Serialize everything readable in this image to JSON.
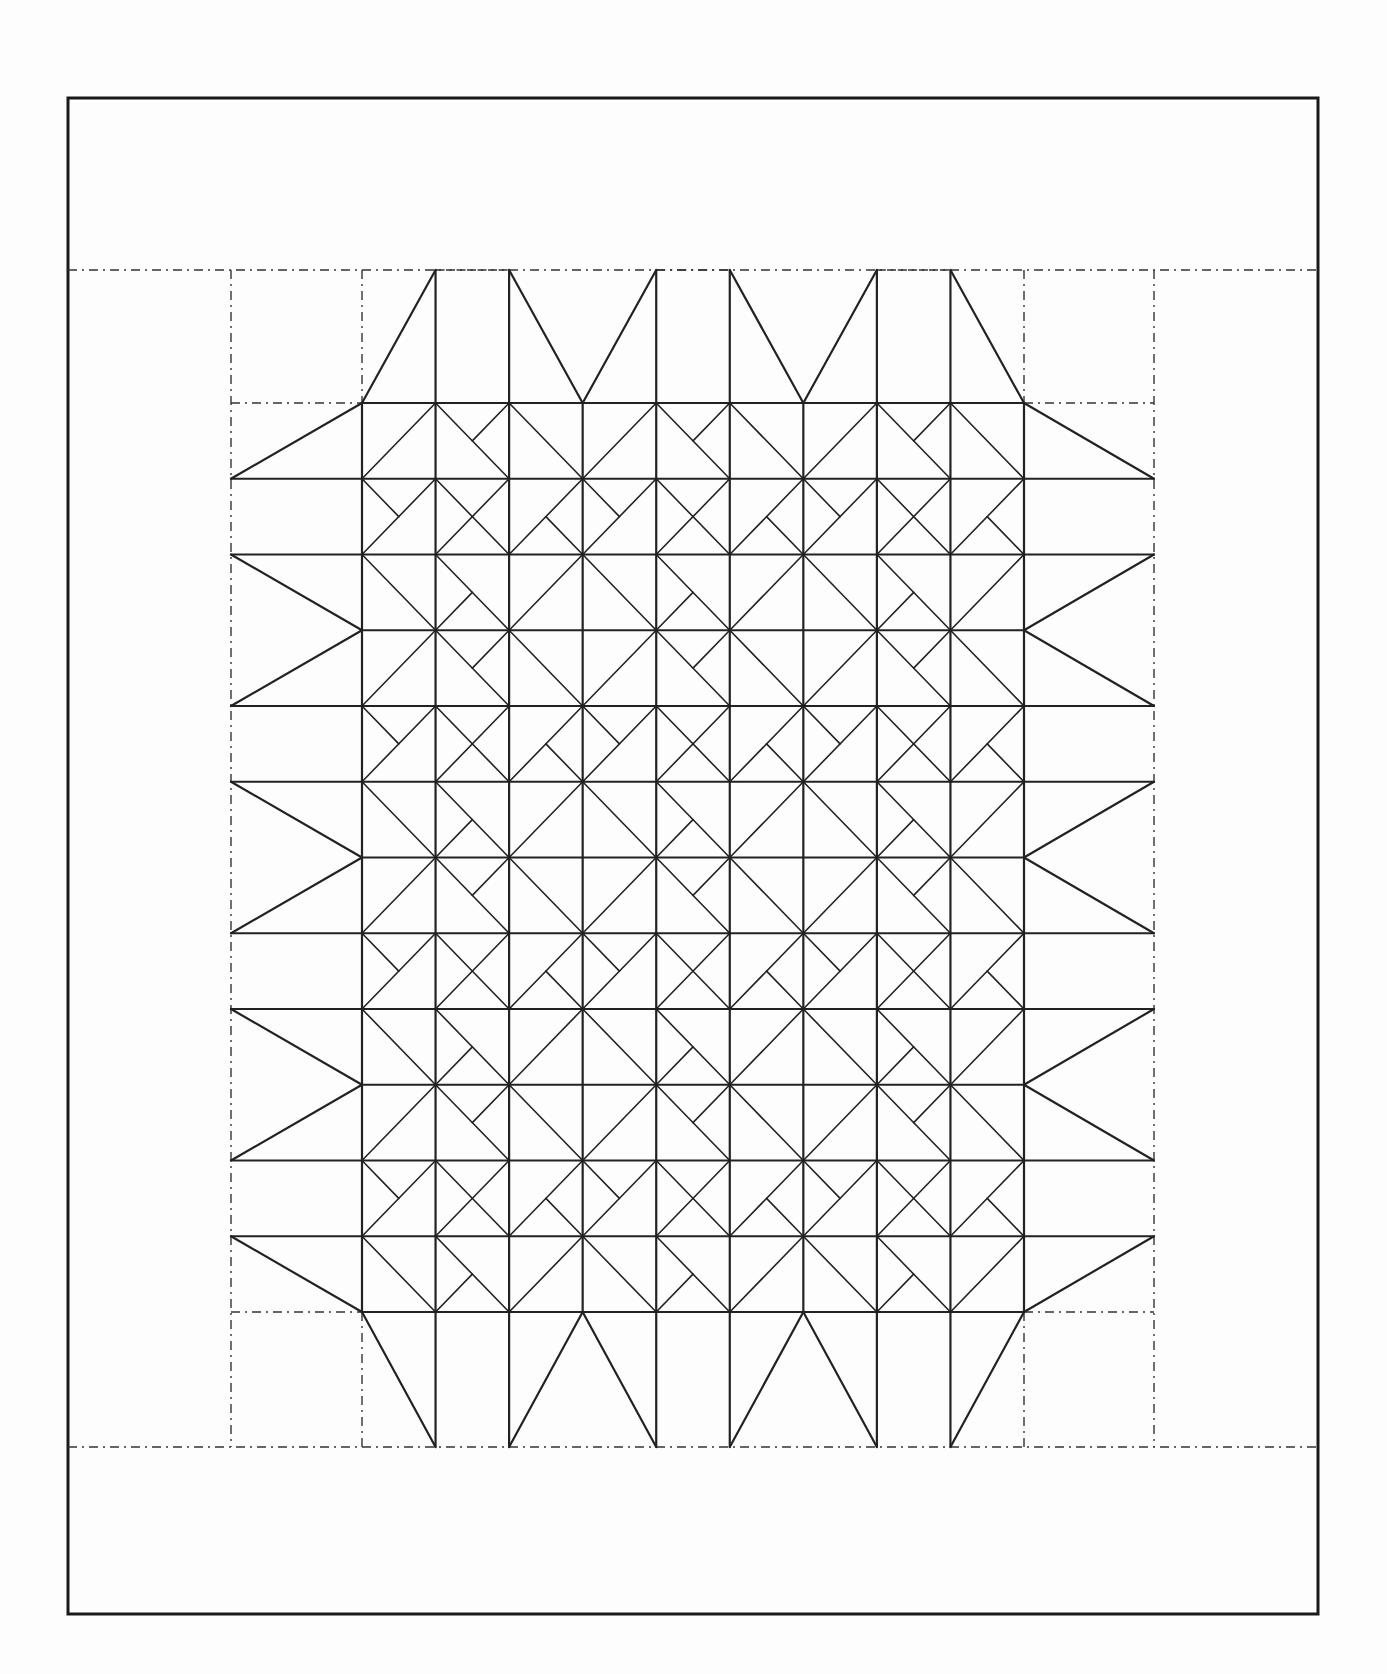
{
  "diagram": {
    "colors": {
      "ink": "#222222",
      "paper": "#fdfdfd",
      "dash": "#333333"
    },
    "frame": {
      "x1": 68,
      "y1": 98,
      "x2": 1318,
      "y2": 1614
    },
    "border_dashes": {
      "top_y": 270,
      "bottom_y": 1447,
      "left_x": 231,
      "right_x": 1154
    },
    "grid": {
      "x0": 362,
      "y0": 403,
      "x1": 1024,
      "y1": 1312,
      "cols": 9,
      "rows": 12
    },
    "tile_3x3": [
      [
        {
          "d": "/",
          "h": null
        },
        {
          "d": "\\",
          "h": "TR"
        },
        {
          "d": "\\",
          "h": null
        }
      ],
      [
        {
          "d": "/",
          "h": "TL"
        },
        {
          "d": "X",
          "h": null
        },
        {
          "d": "/",
          "h": "BR"
        }
      ],
      [
        {
          "d": "\\",
          "h": null
        },
        {
          "d": "\\",
          "h": "BL"
        },
        {
          "d": "/",
          "h": null
        }
      ]
    ],
    "edge_triangles": {
      "description": "Period-3 flying-geese triangles on all four sides; positions 0 and 2 of each 3-group carry a triangle, position 1 is a plain strip",
      "pattern": [
        "to-next",
        "empty",
        "from-this"
      ]
    },
    "corner_squares": [
      "top-left",
      "top-right",
      "bottom-left",
      "bottom-right"
    ]
  }
}
